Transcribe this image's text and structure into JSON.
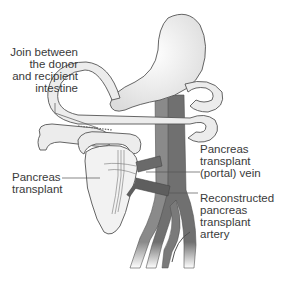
{
  "diagram": {
    "labels": {
      "join": "Join between\nthe donor\nand recipient\nintestine",
      "pancreas": "Pancreas\ntransplant",
      "vein": "Pancreas\ntransplant\n(portal) vein",
      "artery": "Reconstructed\npancreas\ntransplant\nartery"
    },
    "structures": [
      "stomach",
      "small intestine",
      "pancreas transplant",
      "donor duodenum segment",
      "portal vein",
      "aorta",
      "vena cava",
      "iliac vessels"
    ],
    "colors": {
      "organ_fill": "#f0f0f0",
      "organ_stroke": "#555555",
      "vessel_dark": "#6b6b6b",
      "vessel_light": "#8e8e8e",
      "text": "#3a3a3a",
      "leader_line": "#555555"
    }
  }
}
